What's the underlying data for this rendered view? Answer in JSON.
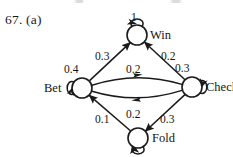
{
  "exercise": {
    "label": "67. (a)"
  },
  "colors": {
    "stroke": "#1a1a1a",
    "background": "#ffffff",
    "text": "#151515"
  },
  "diagram": {
    "type": "state-transition-diagram",
    "nodes": [
      {
        "id": "win",
        "label": "Win",
        "cx": 137,
        "cy": 35,
        "r": 10,
        "label_x": 150,
        "label_y": 28
      },
      {
        "id": "bet",
        "label": "Bet",
        "cx": 82,
        "cy": 88,
        "r": 10,
        "label_x": 44,
        "label_y": 81
      },
      {
        "id": "check",
        "label": "Check",
        "cx": 192,
        "cy": 87,
        "r": 10,
        "label_x": 206,
        "label_y": 80
      },
      {
        "id": "fold",
        "label": "Fold",
        "cx": 138,
        "cy": 138,
        "r": 10,
        "label_x": 152,
        "label_y": 131
      }
    ],
    "self_loops": [
      {
        "id": "win-loop",
        "from": "win",
        "to": "win",
        "weight": "1",
        "weight_x": 131,
        "weight_y": 11
      },
      {
        "id": "bet-loop",
        "from": "bet",
        "to": "bet",
        "weight": "0.4",
        "weight_x": 64,
        "weight_y": 63
      },
      {
        "id": "check-loop",
        "from": "check",
        "to": "check",
        "weight": "0.3",
        "weight_x": 175,
        "weight_y": 62
      },
      {
        "id": "fold-loop",
        "from": "fold",
        "to": "fold",
        "weight": "",
        "weight_x": 0,
        "weight_y": 0
      }
    ],
    "edges": [
      {
        "id": "bet-win",
        "from": "bet",
        "to": "win",
        "weight": "0.3",
        "weight_x": 95,
        "weight_y": 50
      },
      {
        "id": "check-win",
        "from": "check",
        "to": "win",
        "weight": "0.2",
        "weight_x": 161,
        "weight_y": 50
      },
      {
        "id": "bet-check",
        "from": "bet",
        "to": "check",
        "weight": "0.2",
        "weight_x": 126,
        "weight_y": 63
      },
      {
        "id": "check-bet",
        "from": "check",
        "to": "bet",
        "weight": "0.2",
        "weight_x": 126,
        "weight_y": 108
      },
      {
        "id": "fold-bet",
        "from": "fold",
        "to": "bet",
        "weight": "0.1",
        "weight_x": 95,
        "weight_y": 113
      },
      {
        "id": "check-fold",
        "from": "check",
        "to": "fold",
        "weight": "0.3",
        "weight_x": 160,
        "weight_y": 113
      }
    ]
  }
}
